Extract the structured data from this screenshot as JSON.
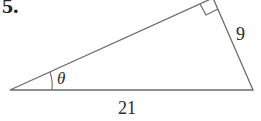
{
  "problem": {
    "number": "5.",
    "angle_label": "θ",
    "hypotenuse_label": "21",
    "opposite_label": "9"
  },
  "colors": {
    "line": "#6b6b6b",
    "text": "#2a2a2a"
  }
}
